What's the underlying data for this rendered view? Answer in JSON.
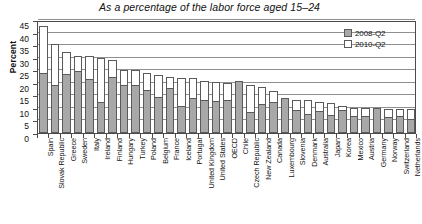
{
  "chart": {
    "title": "As a percentage of the labor force aged 15–24",
    "ylabel": "Percent",
    "legend": {
      "position": "top-right",
      "entries": [
        {
          "label": "2008-Q2",
          "swatch": "filled-gray"
        },
        {
          "label": "2010-Q2",
          "swatch": "hollow-white"
        }
      ]
    }
  },
  "chart_data": {
    "type": "bar",
    "title": "As a percentage of the labor force aged 15–24",
    "subtitle": "",
    "xlabel": "",
    "ylabel": "Percent",
    "ylim": [
      0,
      45
    ],
    "yticks": [
      0,
      5,
      10,
      15,
      20,
      25,
      30,
      35,
      40,
      45
    ],
    "grid": true,
    "grid_axis": "y",
    "legend_position": "top-right",
    "overlap_style": "overlaid-bars-2010-behind-2008",
    "colors": {
      "series_2008": "#a8a8a8",
      "series_2010": "#ffffff",
      "outline": "#5a5a5a",
      "axis": "#4a4a4a",
      "gridline": "#8f8f8f"
    },
    "categories": [
      "Spain",
      "Slovak Republic",
      "Greece",
      "Sweden",
      "Italy",
      "Ireland",
      "Finland",
      "Hungary",
      "Turkey",
      "Poland",
      "Belgium",
      "France",
      "Iceland",
      "Portugal",
      "United Kingdom",
      "United States",
      "OECD",
      "Chile",
      "Czech Republic",
      "New Zealand",
      "Canada",
      "Luxembourg",
      "Slovenia",
      "Denmark",
      "Australia",
      "Japan",
      "Korea",
      "Mexico",
      "Austria",
      "Germany",
      "Norway",
      "Switzerland",
      "Netherlands"
    ],
    "series": [
      {
        "name": "2008-Q2",
        "values": [
          24.0,
          19.3,
          23.6,
          24.6,
          21.5,
          12.4,
          22.3,
          19.0,
          19.0,
          17.3,
          14.4,
          18.0,
          10.9,
          13.9,
          13.1,
          12.8,
          13.2,
          20.6,
          8.5,
          11.6,
          12.2,
          14.0,
          9.2,
          7.4,
          8.6,
          7.0,
          9.0,
          6.9,
          6.6,
          9.9,
          6.2,
          6.9,
          5.4
        ]
      },
      {
        "name": "2010-Q2",
        "values": [
          42.8,
          35.4,
          32.3,
          30.8,
          30.5,
          29.7,
          29.2,
          25.2,
          25.0,
          24.0,
          23.2,
          22.5,
          22.0,
          21.9,
          20.6,
          20.3,
          20.0,
          18.6,
          19.2,
          18.3,
          16.7,
          14.0,
          13.0,
          13.0,
          12.3,
          11.9,
          10.9,
          10.0,
          9.8,
          9.6,
          9.5,
          9.5,
          9.4
        ]
      }
    ]
  }
}
